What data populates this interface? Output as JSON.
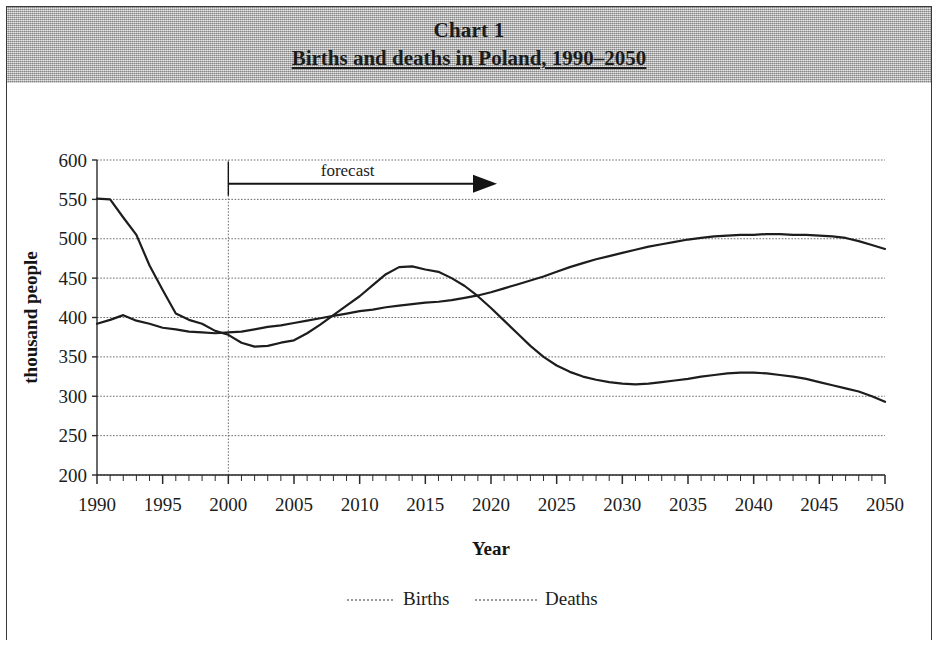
{
  "header": {
    "chart_number": "Chart 1",
    "subtitle": "Births and deaths in Poland, 1990–2050"
  },
  "annotation": {
    "forecast_label": "forecast",
    "forecast_start_year": 2000
  },
  "legend": {
    "births_label": "Births",
    "deaths_label": "Deaths"
  },
  "colors": {
    "header_background": "#b6b6b6",
    "line": "#1d1d1d",
    "gridline": "#6e6e6e",
    "axis": "#2a2a2a",
    "text": "#1b1b1b",
    "page_background": "#ffffff"
  },
  "chart_data": {
    "type": "line",
    "title": "Births and deaths in Poland, 1990–2050",
    "xlabel": "Year",
    "ylabel": "thousand people",
    "xlim": [
      1990,
      2050
    ],
    "ylim": [
      200,
      600
    ],
    "ytick_labels": [
      "200",
      "250",
      "300",
      "350",
      "400",
      "450",
      "500",
      "550",
      "600"
    ],
    "yticks": [
      200,
      250,
      300,
      350,
      400,
      450,
      500,
      550,
      600
    ],
    "xtick_labels": [
      "1990",
      "1995",
      "2000",
      "2005",
      "2010",
      "2015",
      "2020",
      "2025",
      "2030",
      "2035",
      "2040",
      "2045",
      "2050"
    ],
    "xticks": [
      1990,
      1995,
      2000,
      2005,
      2010,
      2015,
      2020,
      2025,
      2030,
      2035,
      2040,
      2045,
      2050
    ],
    "minor_xtick_interval": 1,
    "grid": true,
    "legend_position": "bottom",
    "annotations": [
      {
        "text": "forecast",
        "x_start": 2000,
        "x_end": 2020,
        "y": 570,
        "arrow": true
      }
    ],
    "vertical_marker": {
      "x": 2000,
      "label": "forecast boundary"
    },
    "x": [
      1990,
      1991,
      1992,
      1993,
      1994,
      1995,
      1996,
      1997,
      1998,
      1999,
      2000,
      2001,
      2002,
      2003,
      2004,
      2005,
      2006,
      2007,
      2008,
      2009,
      2010,
      2011,
      2012,
      2013,
      2014,
      2015,
      2016,
      2017,
      2018,
      2019,
      2020,
      2021,
      2022,
      2023,
      2024,
      2025,
      2026,
      2027,
      2028,
      2029,
      2030,
      2031,
      2032,
      2033,
      2034,
      2035,
      2036,
      2037,
      2038,
      2039,
      2040,
      2041,
      2042,
      2043,
      2044,
      2045,
      2046,
      2047,
      2048,
      2049,
      2050
    ],
    "series": [
      {
        "name": "Births",
        "values": [
          551,
          550,
          527,
          505,
          466,
          435,
          405,
          397,
          392,
          383,
          378,
          368,
          363,
          364,
          368,
          371,
          380,
          391,
          403,
          415,
          427,
          441,
          455,
          464,
          465,
          461,
          458,
          450,
          440,
          427,
          412,
          396,
          380,
          364,
          350,
          339,
          331,
          325,
          321,
          318,
          316,
          315,
          316,
          318,
          320,
          322,
          325,
          327,
          329,
          330,
          330,
          329,
          327,
          325,
          322,
          318,
          314,
          310,
          306,
          300,
          293
        ]
      },
      {
        "name": "Deaths",
        "values": [
          392,
          397,
          403,
          396,
          392,
          387,
          385,
          382,
          381,
          380,
          381,
          382,
          385,
          388,
          390,
          393,
          396,
          399,
          402,
          405,
          408,
          410,
          413,
          415,
          417,
          419,
          420,
          422,
          425,
          428,
          432,
          437,
          442,
          447,
          452,
          458,
          464,
          469,
          474,
          478,
          482,
          486,
          490,
          493,
          496,
          499,
          501,
          503,
          504,
          505,
          505,
          506,
          506,
          505,
          505,
          504,
          503,
          501,
          497,
          492,
          487
        ]
      }
    ]
  }
}
